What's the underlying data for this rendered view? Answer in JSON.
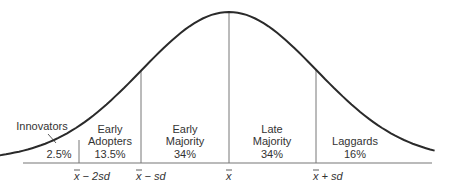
{
  "chart_data": {
    "type": "area",
    "title": "",
    "axis_ticks": [
      {
        "key": "mean_minus_2sd",
        "bar": "x",
        "label": " − 2sd"
      },
      {
        "key": "mean_minus_sd",
        "bar": "x",
        "label": " − sd"
      },
      {
        "key": "mean",
        "bar": "x",
        "label": ""
      },
      {
        "key": "mean_plus_sd",
        "bar": "x",
        "label": " + sd"
      }
    ],
    "segments": [
      {
        "name": "Innovators",
        "lines": [
          "Innovators"
        ],
        "percent": "2.5%",
        "value": 2.5
      },
      {
        "name": "Early Adopters",
        "lines": [
          "Early",
          "Adopters"
        ],
        "percent": "13.5%",
        "value": 13.5
      },
      {
        "name": "Early Majority",
        "lines": [
          "Early",
          "Majority"
        ],
        "percent": "34%",
        "value": 34
      },
      {
        "name": "Late Majority",
        "lines": [
          "Late",
          "Majority"
        ],
        "percent": "34%",
        "value": 34
      },
      {
        "name": "Laggards",
        "lines": [
          "Laggards"
        ],
        "percent": "16%",
        "value": 16
      }
    ],
    "x_range_sd": [
      -3.35,
      2.35
    ],
    "curve": "normal",
    "colors": {
      "curve": "#2a2a2a",
      "lines": "#777777",
      "text": "#333333"
    }
  }
}
